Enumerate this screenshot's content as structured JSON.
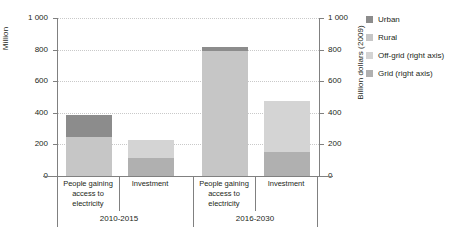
{
  "chart_data": {
    "type": "bar",
    "subtype": "stacked-bar-dual-axis",
    "title": "",
    "xlabel": "",
    "ylabel": "Million",
    "ylabel_right": "Billion dollars (2009)",
    "ylim": [
      0,
      1000
    ],
    "ylim_right": [
      0,
      1000
    ],
    "grid": true,
    "legend_position": "right",
    "y_ticks": [
      "0",
      "200",
      "400",
      "600",
      "800",
      "1 000"
    ],
    "y_tick_values": [
      0,
      200,
      400,
      600,
      800,
      1000
    ],
    "y_ticks_right": [
      "0",
      "200",
      "400",
      "600",
      "800",
      "1 000"
    ],
    "y_tick_values_right": [
      0,
      200,
      400,
      600,
      800,
      1000
    ],
    "categories": [
      "People gaining access to electricity",
      "Investment",
      "People gaining access to electricity",
      "Investment"
    ],
    "groups": [
      {
        "label": "2010-2015",
        "categories": [
          "People gaining access to electricity",
          "Investment"
        ]
      },
      {
        "label": "2016-2030",
        "categories": [
          "People gaining access to electricity",
          "Investment"
        ]
      }
    ],
    "series": [
      {
        "name": "Urban",
        "axis": "left",
        "color": "#8c8c8c",
        "values": [
          140,
          null,
          25,
          null
        ]
      },
      {
        "name": "Rural",
        "axis": "left",
        "color": "#c6c6c6",
        "values": [
          245,
          null,
          790,
          null
        ]
      },
      {
        "name": "Off-grid (right axis)",
        "axis": "right",
        "color": "#d4d4d4",
        "values": [
          null,
          110,
          null,
          325
        ]
      },
      {
        "name": "Grid (right axis)",
        "axis": "right",
        "color": "#b0b0b0",
        "values": [
          null,
          115,
          null,
          150
        ]
      }
    ],
    "bar_totals": [
      385,
      225,
      815,
      475
    ]
  },
  "legend": {
    "items": [
      {
        "label": "Urban",
        "color": "#8c8c8c"
      },
      {
        "label": "Rural",
        "color": "#c6c6c6"
      },
      {
        "label": "Off-grid (right axis)",
        "color": "#d4d4d4"
      },
      {
        "label": "Grid (right axis)",
        "color": "#b0b0b0"
      }
    ]
  },
  "axes": {
    "left_title": "Million",
    "right_title": "Billion dollars (2009)"
  }
}
